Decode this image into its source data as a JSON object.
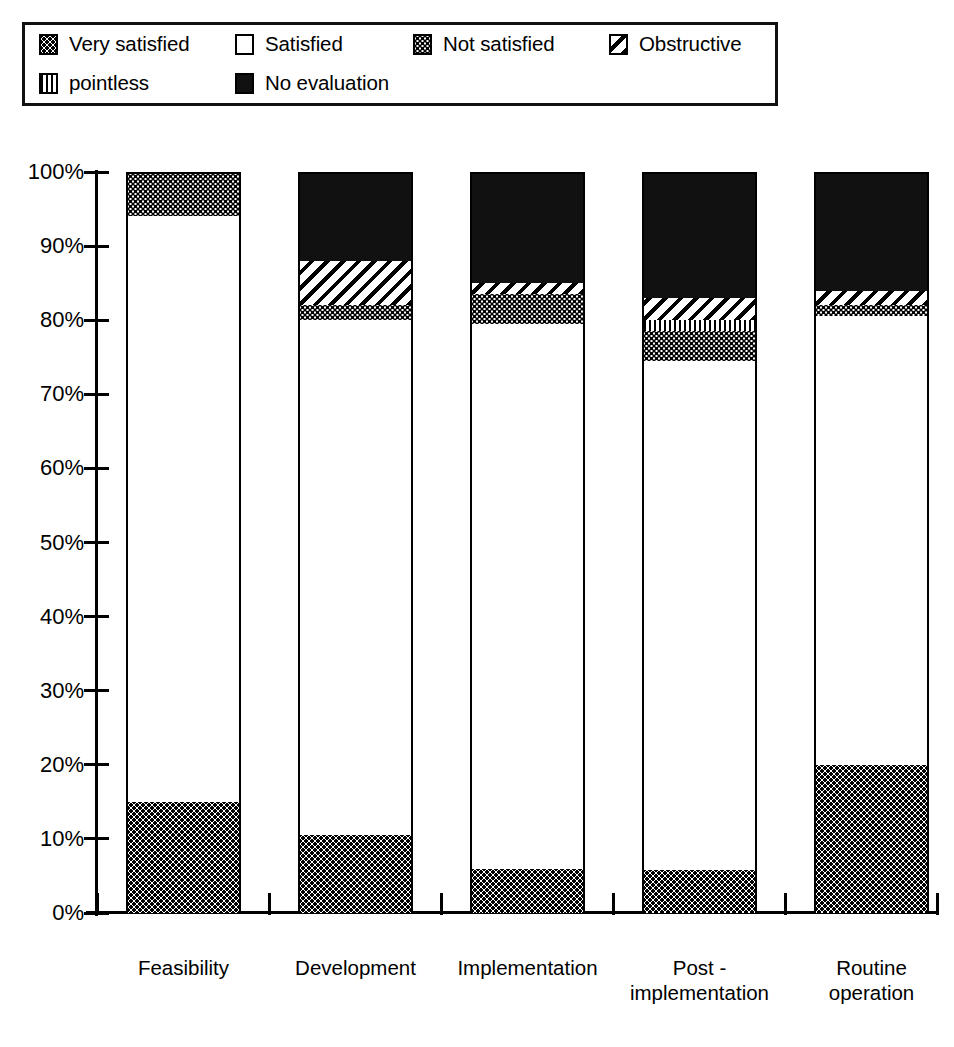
{
  "legend": {
    "items": [
      {
        "label": "Very satisfied",
        "pattern": "fill-dot-coarse",
        "icon": "dotted-swatch-icon"
      },
      {
        "label": "Satisfied",
        "pattern": "fill-white",
        "icon": "white-swatch-icon"
      },
      {
        "label": "Not satisfied",
        "pattern": "fill-dot-fine",
        "icon": "fine-dotted-swatch-icon"
      },
      {
        "label": "Obstructive",
        "pattern": "fill-diag",
        "icon": "diagonal-hatch-swatch-icon"
      },
      {
        "label": "pointless",
        "pattern": "fill-vert",
        "icon": "vertical-hatch-swatch-icon"
      },
      {
        "label": "No evaluation",
        "pattern": "fill-black",
        "icon": "black-swatch-icon"
      }
    ]
  },
  "axis": {
    "y_ticks": [
      "100%",
      "90%",
      "80%",
      "70%",
      "60%",
      "50%",
      "40%",
      "30%",
      "20%",
      "10%",
      "0%"
    ]
  },
  "chart_data": {
    "type": "bar",
    "subtype": "stacked-100-percent",
    "title": "",
    "xlabel": "",
    "ylabel": "",
    "ylim": [
      0,
      100
    ],
    "ytick_values": [
      0,
      10,
      20,
      30,
      40,
      50,
      60,
      70,
      80,
      90,
      100
    ],
    "grid": false,
    "legend_position": "top",
    "categories": [
      "Feasibility",
      "Development",
      "Implementation",
      "Post -\nimplementation",
      "Routine\noperation"
    ],
    "series": [
      {
        "name": "Very satisfied",
        "pattern": "fill-dot-coarse",
        "values": [
          15.0,
          10.5,
          6.0,
          5.8,
          20.0
        ]
      },
      {
        "name": "Satisfied",
        "pattern": "fill-white",
        "values": [
          79.0,
          69.5,
          73.5,
          68.7,
          60.5
        ]
      },
      {
        "name": "Not satisfied",
        "pattern": "fill-dot-fine",
        "values": [
          6.0,
          2.0,
          4.0,
          4.0,
          1.5
        ]
      },
      {
        "name": "pointless",
        "pattern": "fill-vert",
        "values": [
          0.0,
          0.0,
          0.0,
          1.5,
          0.0
        ]
      },
      {
        "name": "Obstructive",
        "pattern": "fill-diag",
        "values": [
          0.0,
          6.0,
          1.5,
          3.0,
          2.0
        ]
      },
      {
        "name": "No evaluation",
        "pattern": "fill-black",
        "values": [
          0.0,
          12.0,
          15.0,
          17.0,
          16.0
        ]
      }
    ]
  }
}
